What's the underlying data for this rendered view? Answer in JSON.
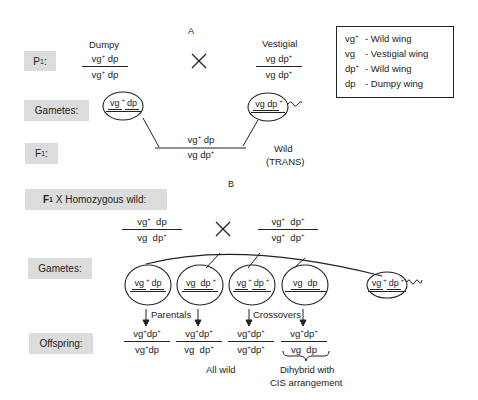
{
  "section_a": {
    "label": "A",
    "p1_label": "P",
    "p1_sub": "1",
    "gametes_label": "Gametes:",
    "f1_label": "F",
    "f1_sub": "1",
    "cross_symbol": "×",
    "dumpy": {
      "title": "Dumpy",
      "top": [
        "vg",
        "+",
        " dp"
      ],
      "bottom": [
        "vg",
        "+",
        " dp"
      ]
    },
    "vestigial": {
      "title": "Vestigial",
      "top": [
        "vg dp",
        "+"
      ],
      "bottom": [
        "vg dp",
        "+"
      ]
    },
    "gamete_left": [
      "vg",
      "+",
      "dp"
    ],
    "gamete_right": [
      "vg dp",
      "+"
    ],
    "f1_genotype": {
      "top": [
        "vg",
        "+",
        "  dp"
      ],
      "bottom": [
        "vg  dp",
        "+"
      ]
    },
    "f1_phenotype": "Wild",
    "f1_arrangement": "(TRANS)"
  },
  "legend": [
    {
      "symbol": "vg",
      "sup": "+",
      "desc": "- Wild wing"
    },
    {
      "symbol": "vg",
      "sup": "",
      "desc": "- Vestigial wing"
    },
    {
      "symbol": "dp",
      "sup": "+",
      "desc": "- Wild wing"
    },
    {
      "symbol": "dp",
      "sup": "",
      "desc": "- Dumpy wing"
    }
  ],
  "section_b": {
    "label": "B",
    "cross_label_f": "F",
    "cross_label_sub": "1",
    "cross_label_rest": " X Homozygous wild:",
    "cross_symbol": "×",
    "parent_left": {
      "top": [
        "vg",
        "+",
        "  dp"
      ],
      "bottom": [
        "vg  dp",
        "+"
      ]
    },
    "parent_right": {
      "top": [
        "vg",
        "+",
        "  dp",
        "+"
      ],
      "bottom": [
        "vg",
        "+",
        "  dp",
        "+"
      ]
    },
    "gametes_label": "Gametes:",
    "offspring_label": "Offspring:",
    "gametes": [
      [
        "vg",
        "+",
        "dp",
        ""
      ],
      [
        "vg  dp",
        "+",
        "",
        ""
      ],
      [
        "vg",
        "+",
        "dp",
        "+"
      ],
      [
        "vg  dp",
        "",
        "",
        ""
      ]
    ],
    "wild_gamete": [
      "vg",
      "+",
      "dp",
      "+"
    ],
    "parentals_label": "Parentals",
    "crossovers_label": "Crossovers",
    "offspring": [
      {
        "top": [
          "vg",
          "+",
          "dp",
          "+"
        ],
        "bottom": [
          "vg",
          "+",
          "dp",
          ""
        ]
      },
      {
        "top": [
          "vg",
          "+",
          "dp",
          "+"
        ],
        "bottom": [
          "vg  dp",
          "+",
          "",
          ""
        ]
      },
      {
        "top": [
          "vg",
          "+",
          "dp",
          "+"
        ],
        "bottom": [
          "vg",
          "+",
          "dp",
          "+"
        ]
      },
      {
        "top": [
          "vg",
          "+",
          "dp",
          "+"
        ],
        "bottom": [
          "vg  dp",
          "",
          "",
          ""
        ]
      }
    ],
    "all_wild": "All wild",
    "dihybrid_line1": "Dihybrid with",
    "dihybrid_line2": "CIS arrangement"
  }
}
